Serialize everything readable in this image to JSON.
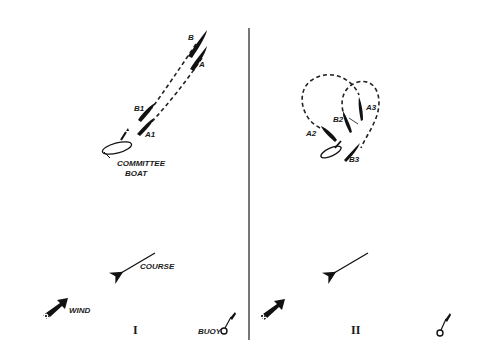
{
  "diagram": {
    "type": "sailing-race-start-diagram",
    "colors": {
      "ink": "#111111",
      "background": "#ffffff",
      "divider": "#555555"
    },
    "panels": [
      {
        "id": "I",
        "numeral": "I",
        "boats": [
          {
            "label": "B",
            "role": "initial position"
          },
          {
            "label": "A",
            "role": "initial position"
          },
          {
            "label": "B1",
            "role": "later position"
          },
          {
            "label": "A1",
            "role": "later position"
          }
        ],
        "committee_boat_label_line1": "COMMITTEE",
        "committee_boat_label_line2": "BOAT",
        "course_label": "COURSE",
        "wind_label": "WIND",
        "buoy_label": "BUOY"
      },
      {
        "id": "II",
        "numeral": "II",
        "boats": [
          {
            "label": "A2",
            "role": "circling"
          },
          {
            "label": "B2",
            "role": "circling"
          },
          {
            "label": "A3",
            "role": "circling"
          },
          {
            "label": "B3",
            "role": "final"
          }
        ],
        "course_label": "",
        "wind_label": "",
        "buoy_label": ""
      }
    ]
  }
}
